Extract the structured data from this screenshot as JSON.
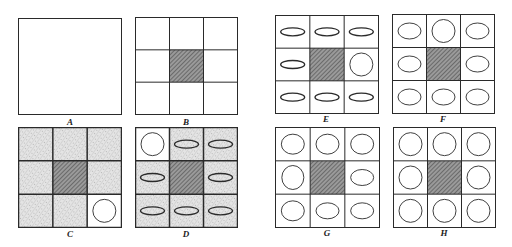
{
  "figure": {
    "colors": {
      "line": "#2a2a2a",
      "hatch": "#555555",
      "stipple": "#cfcfcf",
      "background": "#ffffff"
    },
    "panels": [
      {
        "id": "A",
        "label": "A",
        "x": 18,
        "y": 18,
        "w": 103,
        "h": 96,
        "grid": false,
        "center_hatched": false,
        "cells": []
      },
      {
        "id": "B",
        "label": "B",
        "x": 135,
        "y": 17,
        "w": 102,
        "h": 97,
        "grid": true,
        "center_hatched": true,
        "cells": [
          "empty",
          "empty",
          "empty",
          "empty",
          "hatch",
          "empty",
          "empty",
          "empty",
          "empty"
        ],
        "stippled": []
      },
      {
        "id": "C",
        "label": "C",
        "x": 18,
        "y": 127,
        "w": 103,
        "h": 100,
        "grid": true,
        "center_hatched": true,
        "cells": [
          "empty",
          "empty",
          "empty",
          "empty",
          "hatch",
          "empty",
          "empty",
          "empty",
          "circle"
        ],
        "stippled": [
          0,
          1,
          2,
          3,
          5,
          6,
          7
        ]
      },
      {
        "id": "D",
        "label": "D",
        "x": 135,
        "y": 127,
        "w": 102,
        "h": 100,
        "grid": true,
        "center_hatched": true,
        "cells": [
          "circle",
          "flat",
          "flat",
          "flat",
          "hatch",
          "flat",
          "flat",
          "flat",
          "flat"
        ],
        "stippled": [
          1,
          2,
          3,
          5,
          6,
          7,
          8
        ]
      },
      {
        "id": "E",
        "label": "E",
        "x": 275,
        "y": 15,
        "w": 103,
        "h": 98,
        "grid": true,
        "center_hatched": true,
        "cells": [
          "flat",
          "flat",
          "flat",
          "flat",
          "hatch",
          "circle",
          "flat",
          "flat",
          "flat"
        ],
        "stippled": []
      },
      {
        "id": "F",
        "label": "F",
        "x": 392,
        "y": 14,
        "w": 102,
        "h": 99,
        "grid": true,
        "center_hatched": true,
        "cells": [
          "oval",
          "circle",
          "oval",
          "oval",
          "hatch",
          "oval",
          "oval",
          "oval",
          "oval"
        ],
        "stippled": []
      },
      {
        "id": "G",
        "label": "G",
        "x": 275,
        "y": 127,
        "w": 104,
        "h": 100,
        "grid": true,
        "center_hatched": true,
        "cells": [
          "round",
          "round",
          "round",
          "round-tall",
          "hatch",
          "oval",
          "round",
          "oval",
          "oval"
        ],
        "stippled": []
      },
      {
        "id": "H",
        "label": "H",
        "x": 393,
        "y": 127,
        "w": 102,
        "h": 100,
        "grid": true,
        "center_hatched": true,
        "cells": [
          "circle",
          "circle",
          "circle",
          "circle",
          "hatch",
          "circle",
          "circle",
          "circle",
          "circle"
        ],
        "stippled": []
      }
    ],
    "label_offsets": {
      "top_row_y": 118,
      "bottom_row_y": 230
    }
  }
}
